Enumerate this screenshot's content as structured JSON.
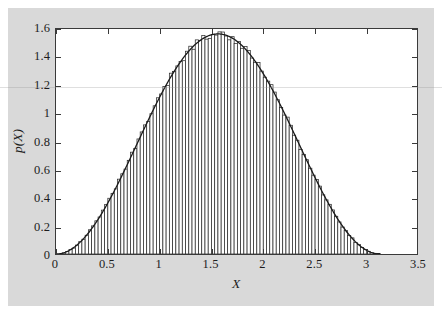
{
  "figure": {
    "background_color": "#d9d9d9",
    "plot_background_color": "#ffffff",
    "frame_color": "#3a3a3a"
  },
  "chart_data": {
    "type": "bar",
    "title": "",
    "subtitle": "",
    "xlabel": "X",
    "ylabel": "p(X)",
    "xlim": [
      0,
      3.5
    ],
    "ylim": [
      0,
      1.6
    ],
    "xticks": [
      0,
      0.5,
      1,
      1.5,
      2,
      2.5,
      3,
      3.5
    ],
    "xtick_labels": [
      "0",
      "0.5",
      "1",
      "1.5",
      "2",
      "2.5",
      "3",
      "3.5"
    ],
    "yticks": [
      0,
      0.2,
      0.4,
      0.6,
      0.8,
      1,
      1.2,
      1.4,
      1.6
    ],
    "ytick_labels": [
      "0",
      "0.2",
      "0.4",
      "0.6",
      "0.8",
      "1",
      "1.2",
      "1.4",
      "1.6"
    ],
    "grid": false,
    "legend": null,
    "annotations": [],
    "series": [
      {
        "name": "histogram",
        "type": "bar",
        "bar_edge_color": "#2b2b2b",
        "bar_fill_color": "#ffffff",
        "bin_width": 0.0314,
        "bin_centers": [
          0.0157,
          0.0471,
          0.0785,
          0.11,
          0.1414,
          0.1728,
          0.2042,
          0.2356,
          0.267,
          0.2985,
          0.3299,
          0.3613,
          0.3927,
          0.4241,
          0.4555,
          0.4869,
          0.5184,
          0.5498,
          0.5812,
          0.6126,
          0.644,
          0.6754,
          0.7069,
          0.7383,
          0.7697,
          0.8011,
          0.8325,
          0.8639,
          0.8954,
          0.9268,
          0.9582,
          0.9896,
          1.021,
          1.0524,
          1.0838,
          1.1153,
          1.1467,
          1.1781,
          1.2095,
          1.2409,
          1.2723,
          1.3038,
          1.3352,
          1.3666,
          1.398,
          1.4294,
          1.4608,
          1.4923,
          1.5237,
          1.5551,
          1.5865,
          1.6179,
          1.6493,
          1.6807,
          1.7122,
          1.7436,
          1.775,
          1.8064,
          1.8378,
          1.8692,
          1.9007,
          1.9321,
          1.9635,
          1.9949,
          2.0263,
          2.0577,
          2.0891,
          2.1206,
          2.152,
          2.1834,
          2.2148,
          2.2462,
          2.2776,
          2.3091,
          2.3405,
          2.3719,
          2.4033,
          2.4347,
          2.4661,
          2.4976,
          2.529,
          2.5604,
          2.5918,
          2.6232,
          2.6546,
          2.686,
          2.7175,
          2.7489,
          2.7803,
          2.8117,
          2.8431,
          2.8745,
          2.906,
          2.9374,
          2.9688,
          3.0002,
          3.0316,
          3.063,
          3.0945,
          3.1259
        ],
        "values": [
          0.0008,
          0.007,
          0.0194,
          0.0379,
          0.0622,
          0.092,
          0.127,
          0.1667,
          0.2106,
          0.2581,
          0.3086,
          0.3616,
          0.4162,
          0.472,
          0.528,
          0.5838,
          0.6384,
          0.6914,
          0.7419,
          0.7894,
          0.8333,
          0.873,
          0.908,
          0.9378,
          0.9621,
          0.9806,
          0.993,
          0.9992,
          0.9992,
          0.993,
          0.9806,
          0.9621,
          0.9378,
          0.908,
          0.873,
          0.8333,
          0.7894,
          0.7419,
          0.6914,
          0.6384,
          0.5838,
          0.528,
          0.472,
          0.4162,
          0.3616,
          0.3086,
          0.2581,
          0.2106,
          0.1667,
          0.127,
          0.092,
          0.0622,
          0.0379,
          0.0194,
          0.007,
          0.0008,
          0.0008,
          0.007,
          0.0194,
          0.0379,
          0.0622,
          0.092,
          0.127,
          0.1667,
          0.2106,
          0.2581,
          0.3086,
          0.3616,
          0.4162,
          0.472,
          0.528,
          0.5838,
          0.6384,
          0.6914,
          0.7419,
          0.7894,
          0.8333,
          0.873,
          0.908,
          0.9378,
          0.9621,
          0.9806,
          0.993,
          0.9992,
          0.9992,
          0.993,
          0.9806,
          0.9621,
          0.9378,
          0.908,
          0.873,
          0.8333,
          0.7894,
          0.7419,
          0.6914,
          0.6384,
          0.5838,
          0.528,
          0.472,
          0.4162
        ]
      },
      {
        "name": "density-curve",
        "type": "line",
        "color": "#1a1a1a",
        "line_width": 1.3,
        "description": "smooth analytic density p(X) peaking at 1.565 near X = 1.57, zero at X = 0 and X = 3.1416",
        "peak_x": 1.5708,
        "peak_y": 1.565,
        "support": [
          0,
          3.1416
        ]
      }
    ],
    "distribution_peak_value": 1.565,
    "distribution_peak_x": 1.57,
    "distribution_support_max": 3.14,
    "n_bins": 100
  },
  "axis": {
    "x_title": "X",
    "y_title": "p(X)"
  }
}
